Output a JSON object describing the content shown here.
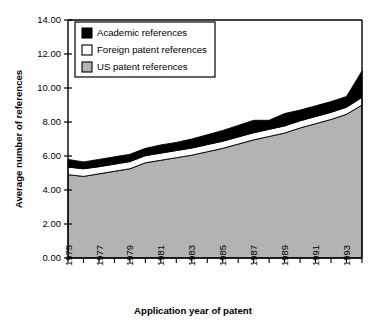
{
  "chart_data": {
    "type": "area",
    "title": "",
    "subtitle": "",
    "xlabel": "Application year of patent",
    "ylabel": "Average number of references",
    "stacked": true,
    "grid": false,
    "legend_position": "top-left-inside",
    "xlim": [
      1975,
      1994
    ],
    "ylim": [
      0.0,
      14.0
    ],
    "ytick_values": [
      0.0,
      2.0,
      4.0,
      6.0,
      8.0,
      10.0,
      12.0,
      14.0
    ],
    "ytick_labels": [
      "0.00",
      "2.00",
      "4.00",
      "6.00",
      "8.00",
      "10.00",
      "12.00",
      "14.00"
    ],
    "x": [
      1975,
      1976,
      1977,
      1978,
      1979,
      1980,
      1981,
      1982,
      1983,
      1984,
      1985,
      1986,
      1987,
      1988,
      1989,
      1990,
      1991,
      1992,
      1993,
      1994
    ],
    "xtick_all": [
      1975,
      1976,
      1977,
      1978,
      1979,
      1980,
      1981,
      1982,
      1983,
      1984,
      1985,
      1986,
      1987,
      1988,
      1989,
      1990,
      1991,
      1992,
      1993,
      1994
    ],
    "xtick_labels": [
      "1975",
      "1977",
      "1979",
      "1981",
      "1983",
      "1985",
      "1987",
      "1989",
      "1991",
      "1993"
    ],
    "xtick_labelled_values": [
      1975,
      1977,
      1979,
      1981,
      1983,
      1985,
      1987,
      1989,
      1991,
      1993
    ],
    "series": [
      {
        "name": "US patent references",
        "color": "#b3b3b3",
        "order": 1,
        "values": [
          4.9,
          4.8,
          4.95,
          5.1,
          5.25,
          5.6,
          5.75,
          5.9,
          6.05,
          6.25,
          6.45,
          6.7,
          6.95,
          7.15,
          7.35,
          7.65,
          7.9,
          8.15,
          8.45,
          9.0
        ]
      },
      {
        "name": "Foreign patent references",
        "color": "#ffffff",
        "order": 2,
        "values": [
          0.45,
          0.45,
          0.42,
          0.42,
          0.42,
          0.42,
          0.42,
          0.42,
          0.42,
          0.42,
          0.42,
          0.42,
          0.42,
          0.42,
          0.42,
          0.42,
          0.42,
          0.42,
          0.42,
          0.45
        ]
      },
      {
        "name": "Academic references",
        "color": "#000000",
        "order": 3,
        "values": [
          0.45,
          0.4,
          0.43,
          0.43,
          0.43,
          0.43,
          0.48,
          0.48,
          0.53,
          0.58,
          0.63,
          0.68,
          0.73,
          0.53,
          0.73,
          0.63,
          0.63,
          0.63,
          0.63,
          1.55
        ]
      }
    ],
    "cumulative_totals": [
      5.8,
      5.65,
      5.8,
      5.95,
      6.1,
      6.45,
      6.65,
      6.8,
      7.0,
      7.25,
      7.5,
      7.8,
      8.1,
      8.1,
      8.5,
      8.7,
      8.95,
      9.2,
      9.5,
      11.0
    ]
  },
  "legend": {
    "items": [
      {
        "label": "Academic references",
        "swatch": "#000000"
      },
      {
        "label": "Foreign patent references",
        "swatch": "#ffffff"
      },
      {
        "label": "US patent references",
        "swatch": "#b3b3b3"
      }
    ]
  },
  "axes": {
    "y_title": "Average number of references",
    "x_title": "Application year of patent"
  }
}
